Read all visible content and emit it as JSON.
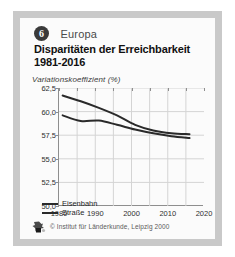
{
  "figure": {
    "number": "6",
    "region": "Europa",
    "title_line1": "Disparitäten der Erreichbarkeit",
    "title_line2": "1981-2016",
    "credit": "© Institut für Länderkunde, Leipzig 2000",
    "logo_icon": "institute-logo-icon",
    "frame_color": "#c9c9c9",
    "plate_color": "#fbfbfb"
  },
  "chart_data": {
    "type": "line",
    "title": "Disparitäten der Erreichbarkeit 1981-2016",
    "xlabel": "",
    "ylabel": "Variationskoeffizient (%)",
    "xlim": [
      1980,
      2020
    ],
    "ylim": [
      50.0,
      62.5
    ],
    "grid": true,
    "legend_position": "inside-bottom-left",
    "xticks": [
      1980,
      1990,
      2000,
      2010,
      2020
    ],
    "xtick_labels": [
      "1980",
      "1990",
      "2000",
      "2010",
      "2020"
    ],
    "xminor_ticks": [
      1985,
      1995,
      2005,
      2015
    ],
    "gridlines_x": [
      1985,
      1990,
      1995,
      2000,
      2005,
      2010,
      2015
    ],
    "yticks": [
      50.0,
      52.5,
      55.0,
      57.5,
      60.0,
      62.5
    ],
    "ytick_labels": [
      "50,0",
      "52,5",
      "55,0",
      "57,5",
      "60,0",
      "62,5"
    ],
    "line_color": "#2a2a2a",
    "series": [
      {
        "name": "Eisenbahn",
        "x": [
          1981,
          1986,
          1991,
          1996,
          2001,
          2006,
          2011,
          2016
        ],
        "values": [
          61.7,
          61.1,
          60.4,
          59.6,
          58.6,
          58.0,
          57.7,
          57.6
        ]
      },
      {
        "name": "Straße",
        "x": [
          1981,
          1986,
          1991,
          1996,
          2001,
          2006,
          2011,
          2016
        ],
        "values": [
          59.6,
          59.0,
          59.05,
          58.6,
          58.1,
          57.7,
          57.4,
          57.2
        ]
      }
    ]
  }
}
